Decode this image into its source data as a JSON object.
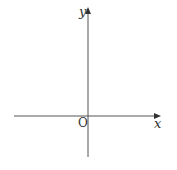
{
  "diagram": {
    "type": "cartesian-axes",
    "x_axis_label": "x",
    "y_axis_label": "y",
    "origin_label": "O",
    "axis_color": "#555555",
    "label_color": "#333333"
  }
}
